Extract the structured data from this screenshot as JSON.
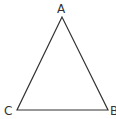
{
  "diagram": {
    "type": "triangle",
    "vertices": [
      {
        "label": "A",
        "x": 62,
        "y": 17
      },
      {
        "label": "C",
        "x": 17,
        "y": 110
      },
      {
        "label": "B",
        "x": 108,
        "y": 110
      }
    ],
    "line_color": "#333333"
  }
}
